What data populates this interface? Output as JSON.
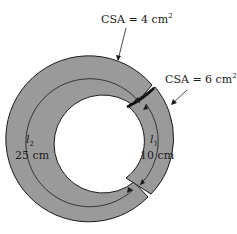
{
  "diagram": {
    "colors": {
      "core_fill": "#9a9a9a",
      "stroke": "#1a1a1a",
      "background": "#ffffff"
    },
    "labels": {
      "csa_top": "CSA = 4 cm",
      "csa_top_exp": "2",
      "csa_right": "CSA = 6 cm",
      "csa_right_exp": "2",
      "l2_symbol": "l",
      "l2_sub": "2",
      "l2_value": "25 cm",
      "l1_symbol": "l",
      "l1_sub": "1",
      "l1_value": "10 cm"
    },
    "sections": [
      {
        "name": "section-1",
        "path_label": "l1",
        "length": "10 cm",
        "csa": "6 cm^2"
      },
      {
        "name": "section-2",
        "path_label": "l2",
        "length": "25 cm",
        "csa": "4 cm^2"
      }
    ]
  }
}
